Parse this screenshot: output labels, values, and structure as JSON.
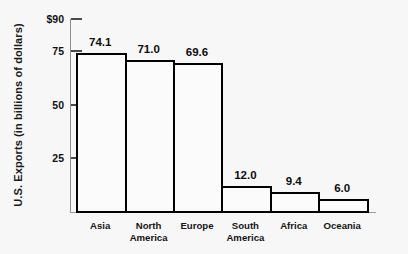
{
  "chart_data": {
    "type": "bar",
    "title": "",
    "xlabel": "",
    "ylabel": "U.S. Exports (in billions of dollars)",
    "categories": [
      "Asia",
      "North\nAmerica",
      "Europe",
      "South\nAmerica",
      "Africa",
      "Oceania"
    ],
    "values": [
      74.1,
      71.0,
      69.6,
      12.0,
      9.4,
      6.0
    ],
    "value_labels": [
      "74.1",
      "71.0",
      "69.6",
      "12.0",
      "9.4",
      "6.0"
    ],
    "ylim": [
      0,
      90
    ],
    "yticks": [
      90,
      75,
      50,
      25
    ],
    "ytick_labels": [
      "$90",
      "75",
      "50",
      "25"
    ],
    "grid": false,
    "legend": false,
    "bar_fill_color": "#fbfbfb",
    "bar_edge_color": "#000000",
    "background_color": "#f7f7f7",
    "axis_color": "#8f8f8f"
  }
}
